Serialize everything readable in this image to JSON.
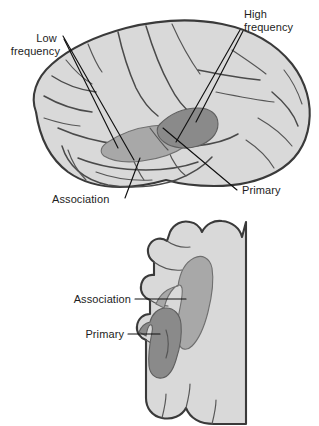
{
  "figure": {
    "background_color": "#ffffff",
    "panels": [
      {
        "id": "lateral-view",
        "name": "Lateral view of cerebral hemisphere",
        "labels": [
          {
            "id": "low-frequency",
            "text_line1": "Low",
            "text_line2": "frequency",
            "align": "right"
          },
          {
            "id": "high-frequency",
            "text_line1": "High",
            "text_line2": "frequency",
            "align": "left"
          },
          {
            "id": "association",
            "text_line1": "Association",
            "align": "left"
          },
          {
            "id": "primary",
            "text_line1": "Primary",
            "align": "left"
          }
        ]
      },
      {
        "id": "coronal-section",
        "name": "Coronal section through auditory cortex",
        "labels": [
          {
            "id": "association",
            "text_line1": "Association",
            "align": "right"
          },
          {
            "id": "primary",
            "text_line1": "Primary",
            "align": "right"
          }
        ]
      }
    ],
    "colors": {
      "brain_fill": "#d9d9d9",
      "brain_outline": "#3a3a3a",
      "association_region": "#a8a8a8",
      "primary_region": "#8a8a8a",
      "leader_line": "#111111",
      "label_text": "#1d1d1d"
    }
  }
}
